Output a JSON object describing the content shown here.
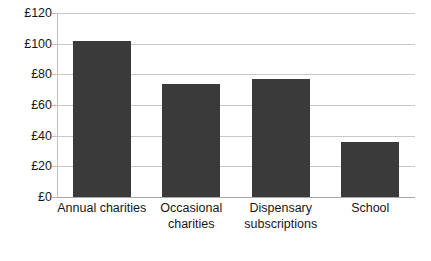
{
  "chart_data": {
    "type": "bar",
    "title": "",
    "subtitle": "",
    "xlabel": "",
    "ylabel": "",
    "categories": [
      "Annual charities",
      "Occasional charities",
      "Dispensary subscriptions",
      "School"
    ],
    "values": [
      102,
      74,
      77,
      36
    ],
    "series": [
      {
        "name": "Expenditure",
        "values": [
          102,
          74,
          77,
          36
        ]
      }
    ],
    "ylim": [
      0,
      120
    ],
    "ytick_values": [
      0,
      20,
      40,
      60,
      80,
      100,
      120
    ],
    "ytick_labels": [
      "£0",
      "£20",
      "£40",
      "£60",
      "£80",
      "£100",
      "£120"
    ],
    "currency_symbol": "£",
    "grid": true,
    "grid_axis": "y",
    "legend": false,
    "legend_position": "none",
    "bar_color": "#3a3a3a",
    "gridline_color": "#c9c9c9",
    "axis_color": "#bfbfbf",
    "text_color": "#171717",
    "background_color": "#ffffff"
  },
  "category_label_lines": [
    [
      "Annual charities"
    ],
    [
      "Occasional",
      "charities"
    ],
    [
      "Dispensary",
      "subscriptions"
    ],
    [
      "School"
    ]
  ]
}
